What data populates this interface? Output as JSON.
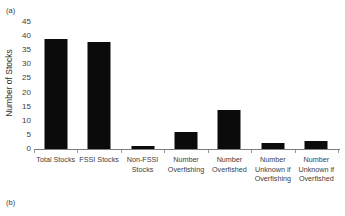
{
  "figure": {
    "panel_a_label": "(a)",
    "panel_b_label": "(b)"
  },
  "chart_data": {
    "type": "bar",
    "title": "",
    "xlabel": "",
    "ylabel": "Number of Stocks",
    "categories": [
      "Total Stocks",
      "FSSI Stocks",
      "Non-FSSI\nStocks",
      "Number\nOverfishing",
      "Number\nOverfished",
      "Number\nUnknown if\nOverfishing",
      "Number\nUnknown if\nOverfished"
    ],
    "values": [
      39,
      38,
      1,
      6,
      14,
      2,
      3
    ],
    "ylim": [
      0,
      45
    ],
    "ytick_values": [
      0,
      5,
      10,
      15,
      20,
      25,
      30,
      35,
      40,
      45
    ],
    "ytick_labels": [
      "0",
      "5",
      "10",
      "15",
      "20",
      "25",
      "30",
      "35",
      "40",
      "45"
    ],
    "grid": false,
    "legend": false,
    "bar_color": "#0b0b0b",
    "axis_color": "#7d7d7d",
    "text_color": "#3d3d3d"
  }
}
